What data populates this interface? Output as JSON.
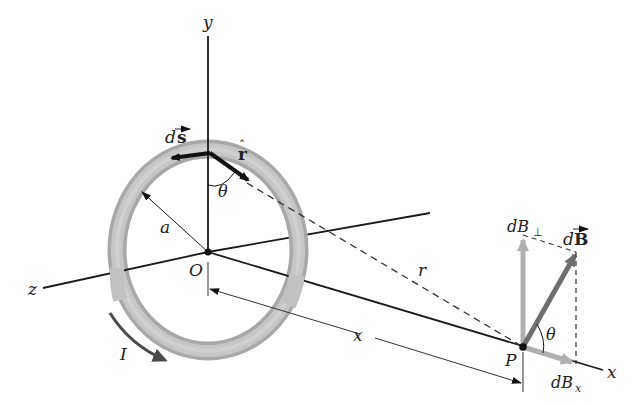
{
  "diagram": {
    "type": "physics-figure",
    "axes": {
      "y_label": "y",
      "z_label": "z",
      "x_label": "x"
    },
    "points": {
      "origin_label": "O",
      "field_point_label": "P"
    },
    "loop": {
      "radius_label": "a",
      "current_label": "I",
      "element_label_d": "d",
      "element_label_s": "s",
      "unit_vector_label": "r",
      "angle_label": "θ"
    },
    "distances": {
      "separation_label": "r",
      "axial_distance_label": "x"
    },
    "field": {
      "total_label_d": "d",
      "total_label_B": "B",
      "perp_label": "dB",
      "perp_subscript": "⊥",
      "axial_label": "dB",
      "axial_subscript": "x",
      "angle_label": "θ"
    },
    "colors": {
      "ring": "#b5b5b5",
      "ring_edge": "#9a9a9a",
      "axis": "#1a1a1a",
      "dB_total": "#6e6e6e",
      "dB_components": "#b0b0b0",
      "current_arrow": "#4a4a4a"
    }
  }
}
